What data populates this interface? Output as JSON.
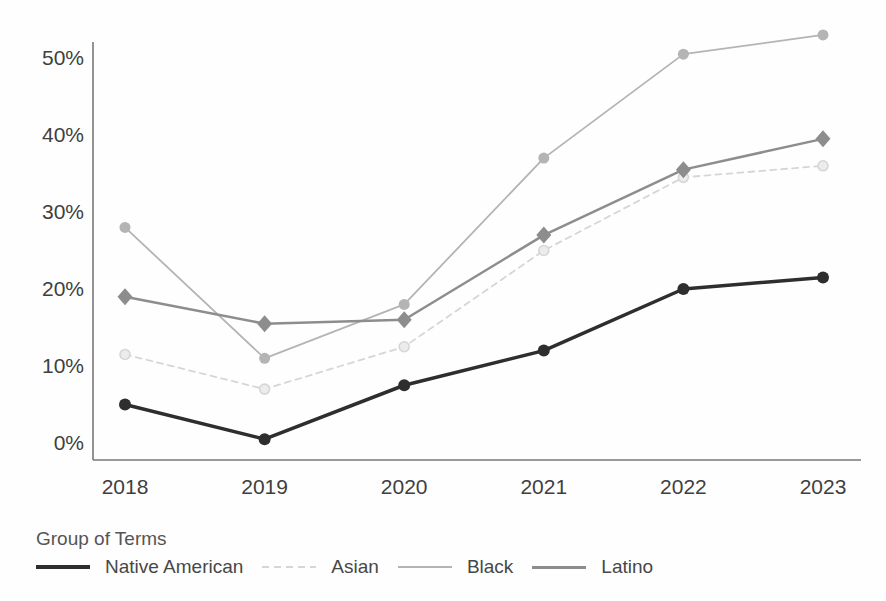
{
  "chart_data": {
    "type": "line",
    "title": "",
    "xlabel": "",
    "ylabel": "",
    "categories": [
      "2018",
      "2019",
      "2020",
      "2021",
      "2022",
      "2023"
    ],
    "y_ticks": [
      {
        "label": "0%",
        "value": 0
      },
      {
        "label": "10%",
        "value": 10
      },
      {
        "label": "20%",
        "value": 20
      },
      {
        "label": "30%",
        "value": 30
      },
      {
        "label": "40%",
        "value": 40
      },
      {
        "label": "50%",
        "value": 50
      }
    ],
    "ylim": [
      0,
      55
    ],
    "grid": false,
    "legend_title": "Group of Terms",
    "legend_position": "bottom-left",
    "axis_color": "#787878",
    "tick_label_color": "#3f3f3f",
    "series": [
      {
        "name": "Native American",
        "color": "#2e2e2e",
        "marker": "circle",
        "marker_size": 6,
        "dash": false,
        "width": 3.5,
        "values": [
          5,
          0.5,
          7.5,
          12,
          20,
          21.5
        ]
      },
      {
        "name": "Asian",
        "color": "#d6d6d6",
        "marker": "circle-open",
        "marker_size": 5,
        "dash": true,
        "width": 1.8,
        "values": [
          11.5,
          7,
          12.5,
          25,
          34.5,
          36
        ]
      },
      {
        "name": "Black",
        "color": "#b4b4b4",
        "marker": "circle",
        "marker_size": 5.5,
        "dash": false,
        "width": 1.8,
        "values": [
          28,
          11,
          18,
          37,
          50.5,
          53
        ]
      },
      {
        "name": "Latino",
        "color": "#8d8d8d",
        "marker": "diamond",
        "marker_size": 7.5,
        "dash": false,
        "width": 2.5,
        "values": [
          19,
          15.5,
          16,
          27,
          35.5,
          39.5
        ]
      }
    ]
  }
}
